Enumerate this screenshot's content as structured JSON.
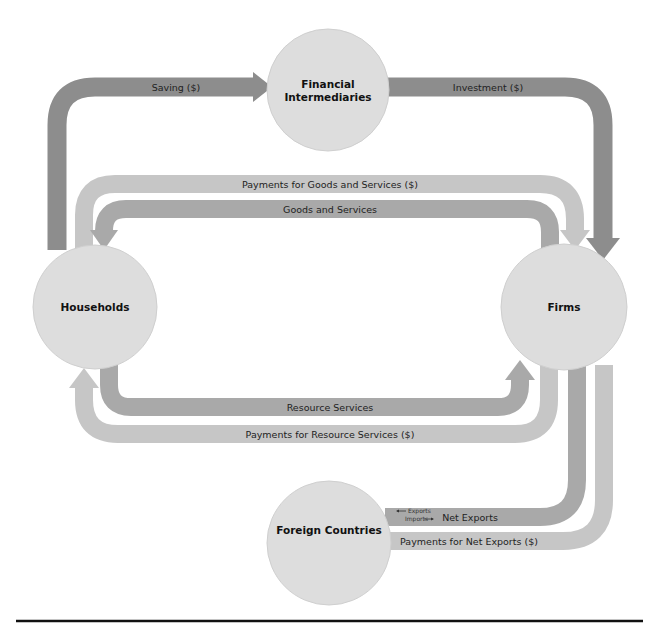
{
  "diagram": {
    "colors": {
      "dark_band": "#8d8d8d",
      "medium_band": "#a9a9a9",
      "light_band": "#c6c6c6",
      "node_fill": "#dddddd",
      "text": "#222222",
      "rule": "#111111"
    },
    "nodes": {
      "financial_intermediaries": {
        "line1": "Financial",
        "line2": "Intermediaries"
      },
      "households": {
        "label": "Households"
      },
      "firms": {
        "label": "Firms"
      },
      "foreign_countries": {
        "label": "Foreign Countries"
      }
    },
    "flows": {
      "saving": "Saving ($)",
      "investment": "Investment ($)",
      "payments_goods_services": "Payments for Goods and Services ($)",
      "goods_services": "Goods and Services",
      "resource_services": "Resource Services",
      "payments_resource_services": "Payments for Resource Services ($)",
      "net_exports": "Net Exports",
      "payments_net_exports": "Payments for Net Exports ($)",
      "exports": "Exports",
      "imports": "Imports"
    }
  }
}
